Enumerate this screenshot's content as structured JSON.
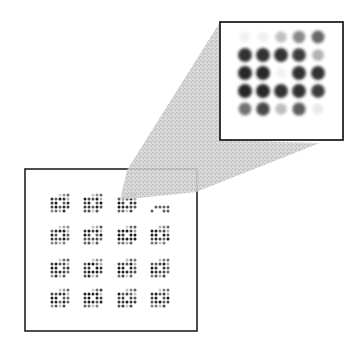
{
  "figure": {
    "colors": {
      "background": "#ffffff",
      "frame": "#222222",
      "dot": "#1a1a1a",
      "wedge": "#c8c8c8"
    },
    "overview_box": {
      "x": 25,
      "y": 169,
      "width": 172,
      "height": 162
    },
    "inset_box": {
      "x": 220,
      "y": 22,
      "width": 123,
      "height": 118
    },
    "wedge_polygon": [
      [
        127,
        170
      ],
      [
        220,
        22
      ],
      [
        220,
        140
      ],
      [
        320,
        143
      ],
      [
        196,
        192
      ],
      [
        120,
        200
      ]
    ],
    "overview_grid": {
      "rows": 4,
      "cols": 4,
      "col_centers": [
        60,
        93,
        127,
        160
      ],
      "row_centers": [
        203,
        235,
        268,
        298
      ],
      "motif_dot_spacing": 4,
      "sparse_cells": [
        [
          0,
          3
        ]
      ]
    },
    "inset_grid": {
      "rows": 5,
      "cols": 5,
      "col_centers": [
        245,
        263,
        281,
        299,
        318
      ],
      "row_centers": [
        37,
        55,
        73,
        91,
        109
      ],
      "dot_radius": 7,
      "intensity": [
        [
          0.06,
          0.06,
          0.28,
          0.55,
          0.7
        ],
        [
          0.95,
          0.95,
          0.95,
          0.9,
          0.35
        ],
        [
          1.0,
          1.0,
          0.05,
          0.95,
          0.95
        ],
        [
          1.0,
          1.0,
          0.95,
          0.95,
          0.9
        ],
        [
          0.65,
          0.85,
          0.3,
          0.75,
          0.1
        ]
      ]
    }
  }
}
